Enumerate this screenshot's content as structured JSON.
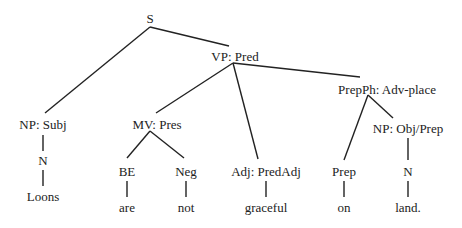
{
  "tree": {
    "nodes": [
      {
        "id": "s",
        "label": "S",
        "x": 150,
        "y": 12
      },
      {
        "id": "vp",
        "label": "VP: Pred",
        "x": 235,
        "y": 50
      },
      {
        "id": "np_subj",
        "label": "NP: Subj",
        "x": 43,
        "y": 118
      },
      {
        "id": "mv",
        "label": "MV: Pres",
        "x": 157,
        "y": 118
      },
      {
        "id": "prepph",
        "label": "PrepPh: Adv-place",
        "x": 387,
        "y": 83
      },
      {
        "id": "n1",
        "label": "N",
        "x": 43,
        "y": 154
      },
      {
        "id": "be",
        "label": "BE",
        "x": 127,
        "y": 165
      },
      {
        "id": "neg",
        "label": "Neg",
        "x": 186,
        "y": 165
      },
      {
        "id": "adj",
        "label": "Adj: PredAdj",
        "x": 266,
        "y": 165
      },
      {
        "id": "np_obj",
        "label": "NP: Obj/Prep",
        "x": 408,
        "y": 122
      },
      {
        "id": "prep",
        "label": "Prep",
        "x": 344,
        "y": 165
      },
      {
        "id": "n2",
        "label": "N",
        "x": 408,
        "y": 165
      },
      {
        "id": "w_loons",
        "label": "Loons",
        "x": 43,
        "y": 190
      },
      {
        "id": "w_are",
        "label": "are",
        "x": 127,
        "y": 201
      },
      {
        "id": "w_not",
        "label": "not",
        "x": 186,
        "y": 201
      },
      {
        "id": "w_graceful",
        "label": "graceful",
        "x": 266,
        "y": 201
      },
      {
        "id": "w_on",
        "label": "on",
        "x": 344,
        "y": 201
      },
      {
        "id": "w_land",
        "label": "land.",
        "x": 408,
        "y": 201
      }
    ],
    "edges": [
      {
        "from": "s",
        "to": "np_subj",
        "x1": 150,
        "y1": 27,
        "x2": 45,
        "y2": 113
      },
      {
        "from": "s",
        "to": "vp",
        "x1": 150,
        "y1": 27,
        "x2": 229,
        "y2": 46
      },
      {
        "from": "vp",
        "to": "mv",
        "x1": 233,
        "y1": 63,
        "x2": 156,
        "y2": 113
      },
      {
        "from": "vp",
        "to": "adj",
        "x1": 233,
        "y1": 63,
        "x2": 258,
        "y2": 159
      },
      {
        "from": "vp",
        "to": "prepph",
        "x1": 233,
        "y1": 63,
        "x2": 360,
        "y2": 77
      },
      {
        "from": "np_subj",
        "to": "n1",
        "x1": 43,
        "y1": 135,
        "x2": 43,
        "y2": 151
      },
      {
        "from": "n1",
        "to": "w_loons",
        "x1": 43,
        "y1": 170,
        "x2": 43,
        "y2": 186
      },
      {
        "from": "mv",
        "to": "be",
        "x1": 150,
        "y1": 131,
        "x2": 127,
        "y2": 158
      },
      {
        "from": "mv",
        "to": "neg",
        "x1": 150,
        "y1": 131,
        "x2": 184,
        "y2": 158
      },
      {
        "from": "be",
        "to": "w_are",
        "x1": 127,
        "y1": 181,
        "x2": 127,
        "y2": 197
      },
      {
        "from": "neg",
        "to": "w_not",
        "x1": 186,
        "y1": 181,
        "x2": 186,
        "y2": 197
      },
      {
        "from": "adj",
        "to": "w_graceful",
        "x1": 266,
        "y1": 181,
        "x2": 266,
        "y2": 197
      },
      {
        "from": "prepph",
        "to": "prep",
        "x1": 368,
        "y1": 95,
        "x2": 344,
        "y2": 160
      },
      {
        "from": "prepph",
        "to": "np_obj",
        "x1": 368,
        "y1": 95,
        "x2": 393,
        "y2": 118
      },
      {
        "from": "np_obj",
        "to": "n2",
        "x1": 408,
        "y1": 138,
        "x2": 408,
        "y2": 160
      },
      {
        "from": "prep",
        "to": "w_on",
        "x1": 344,
        "y1": 181,
        "x2": 344,
        "y2": 197
      },
      {
        "from": "n2",
        "to": "w_land",
        "x1": 408,
        "y1": 181,
        "x2": 408,
        "y2": 197
      }
    ],
    "colors": {
      "line": "#222222",
      "text": "#222222",
      "background": "#ffffff"
    }
  }
}
